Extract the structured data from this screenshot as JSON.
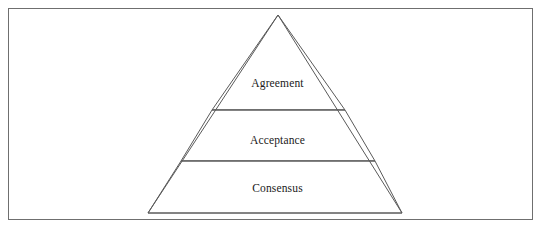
{
  "diagram": {
    "type": "pyramid",
    "orientation": "apex-up",
    "tier_count": 3,
    "tiers": [
      {
        "label": "Agreement",
        "level": 1,
        "position": "top"
      },
      {
        "label": "Acceptance",
        "level": 2,
        "position": "middle"
      },
      {
        "label": "Consensus",
        "level": 3,
        "position": "bottom"
      }
    ],
    "colors": {
      "stroke": "#5a5a5a",
      "frame_stroke": "#6f6f6f",
      "fill": "#ffffff",
      "text": "#1a1a1a",
      "background": "#ffffff"
    },
    "geometry": {
      "apex": [
        278,
        15
      ],
      "base_left": [
        148,
        213
      ],
      "base_right": [
        402,
        213
      ],
      "divider_1_y": 110,
      "divider_2_y": 161,
      "frame": [
        8,
        8,
        525,
        212
      ]
    }
  }
}
